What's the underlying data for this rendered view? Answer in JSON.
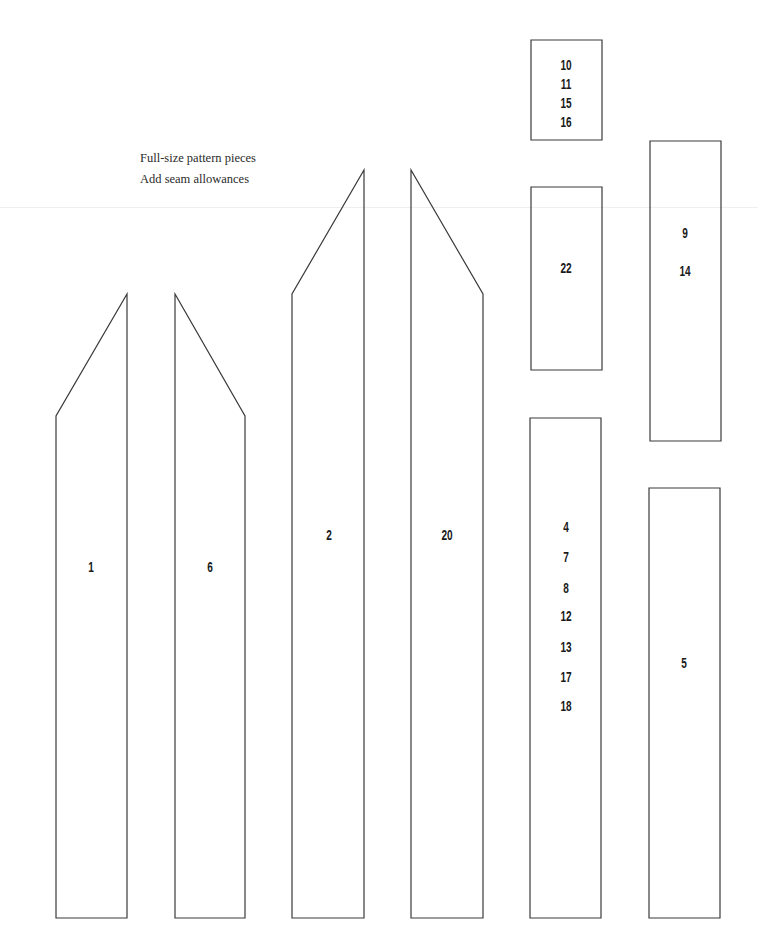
{
  "captions": [
    "Full-size pattern pieces",
    "Add seam allowances"
  ],
  "colors": {
    "stroke": "#3a3a3a",
    "background": "#ffffff",
    "text": "#1a1a1a"
  },
  "pieces": [
    {
      "id": "piece-1",
      "shape": "pointed-left",
      "points": "56,918 56,416 127,294 127,918",
      "labels": [
        {
          "text": "1",
          "x": 91,
          "y": 567
        }
      ]
    },
    {
      "id": "piece-6",
      "shape": "pointed-right",
      "points": "175,918 175,294 245,416 245,918",
      "labels": [
        {
          "text": "6",
          "x": 210,
          "y": 567
        }
      ]
    },
    {
      "id": "piece-2",
      "shape": "pointed-left",
      "points": "292,918 292,294 364,170 364,918",
      "labels": [
        {
          "text": "2",
          "x": 329,
          "y": 535
        }
      ]
    },
    {
      "id": "piece-20",
      "shape": "pointed-right",
      "points": "411,918 411,170 483,294 483,918",
      "labels": [
        {
          "text": "20",
          "x": 447,
          "y": 535
        }
      ]
    },
    {
      "id": "piece-10-11-15-16",
      "shape": "rect",
      "points": "531,40 602,40 602,140 531,140",
      "labels": [
        {
          "text": "10",
          "x": 566,
          "y": 65
        },
        {
          "text": "11",
          "x": 566,
          "y": 84
        },
        {
          "text": "15",
          "x": 566,
          "y": 103
        },
        {
          "text": "16",
          "x": 566,
          "y": 122
        }
      ]
    },
    {
      "id": "piece-22",
      "shape": "rect",
      "points": "531,187 602,187 602,370 531,370",
      "labels": [
        {
          "text": "22",
          "x": 566,
          "y": 268
        }
      ]
    },
    {
      "id": "piece-9-14",
      "shape": "rect",
      "points": "650,141 721,141 721,441 650,441",
      "labels": [
        {
          "text": "9",
          "x": 685,
          "y": 233
        },
        {
          "text": "14",
          "x": 685,
          "y": 271
        }
      ]
    },
    {
      "id": "piece-4-7-8-12-13-17-18",
      "shape": "rect",
      "points": "530,418 601,418 601,918 530,918",
      "labels": [
        {
          "text": "4",
          "x": 566,
          "y": 527
        },
        {
          "text": "7",
          "x": 566,
          "y": 557
        },
        {
          "text": "8",
          "x": 566,
          "y": 588
        },
        {
          "text": "12",
          "x": 566,
          "y": 616
        },
        {
          "text": "13",
          "x": 566,
          "y": 647
        },
        {
          "text": "17",
          "x": 566,
          "y": 677
        },
        {
          "text": "18",
          "x": 566,
          "y": 706
        }
      ]
    },
    {
      "id": "piece-5",
      "shape": "rect",
      "points": "649,488 720,488 720,918 649,918",
      "labels": [
        {
          "text": "5",
          "x": 684,
          "y": 663
        }
      ]
    }
  ]
}
